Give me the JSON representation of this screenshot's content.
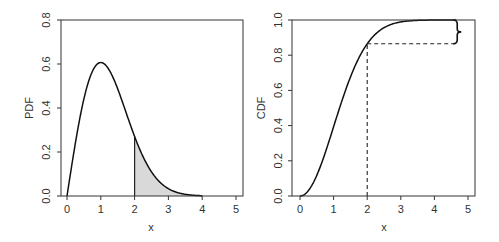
{
  "chart_data": [
    {
      "type": "area",
      "title": "",
      "xlabel": "x",
      "ylabel": "PDF",
      "xlim": [
        -0.2,
        5.2
      ],
      "ylim": [
        0,
        0.8
      ],
      "x_ticks": [
        "0",
        "1",
        "2",
        "3",
        "4",
        "5"
      ],
      "y_ticks": [
        "0.0",
        "0.2",
        "0.4",
        "0.6",
        "0.8"
      ],
      "grid": false,
      "legend": null,
      "distribution": "Rayleigh (sigma = 1)",
      "series": [
        {
          "name": "PDF",
          "x": [
            0,
            0.25,
            0.5,
            0.75,
            1.0,
            1.25,
            1.5,
            1.75,
            2.0,
            2.25,
            2.5,
            2.75,
            3.0,
            3.25,
            3.5,
            3.75,
            4.0
          ],
          "y": [
            0,
            0.242,
            0.441,
            0.567,
            0.607,
            0.573,
            0.487,
            0.379,
            0.271,
            0.179,
            0.11,
            0.063,
            0.033,
            0.016,
            0.008,
            0.003,
            0.001
          ]
        }
      ],
      "shaded_region": {
        "from_x": 2,
        "to_x": 4,
        "fill": "#d9d9d9",
        "meaning": "P(X > 2)"
      },
      "annotations": [
        {
          "type": "vertical-line",
          "x": 2,
          "y_from": 0,
          "y_to": 0.271
        }
      ]
    },
    {
      "type": "line",
      "title": "",
      "xlabel": "x",
      "ylabel": "CDF",
      "xlim": [
        -0.2,
        5.2
      ],
      "ylim": [
        0,
        1.0
      ],
      "x_ticks": [
        "0",
        "1",
        "2",
        "3",
        "4",
        "5"
      ],
      "y_ticks": [
        "0.0",
        "0.2",
        "0.4",
        "0.6",
        "0.8",
        "1.0"
      ],
      "grid": false,
      "legend": null,
      "distribution": "Rayleigh (sigma = 1)",
      "series": [
        {
          "name": "CDF",
          "x": [
            0,
            0.25,
            0.5,
            0.75,
            1.0,
            1.25,
            1.5,
            1.75,
            2.0,
            2.25,
            2.5,
            2.75,
            3.0,
            3.25,
            3.5,
            3.75,
            4.0,
            4.5
          ],
          "y": [
            0,
            0.031,
            0.118,
            0.245,
            0.393,
            0.542,
            0.675,
            0.784,
            0.865,
            0.92,
            0.956,
            0.977,
            0.989,
            0.995,
            0.998,
            0.999,
            1.0,
            1.0
          ]
        }
      ],
      "annotations": [
        {
          "type": "dashed-vertical",
          "x": 2,
          "y_from": 0,
          "y_to": 0.865
        },
        {
          "type": "dashed-horizontal",
          "y": 0.865,
          "x_from": 2,
          "x_to": 4.65
        },
        {
          "type": "curly-brace",
          "x": 4.65,
          "y_from": 0.865,
          "y_to": 1.0,
          "meaning": "1 - CDF(2) = P(X > 2)"
        }
      ]
    }
  ],
  "left_plot": {
    "ylabel": "PDF",
    "xlabel": "x"
  },
  "right_plot": {
    "ylabel": "CDF",
    "xlabel": "x"
  }
}
